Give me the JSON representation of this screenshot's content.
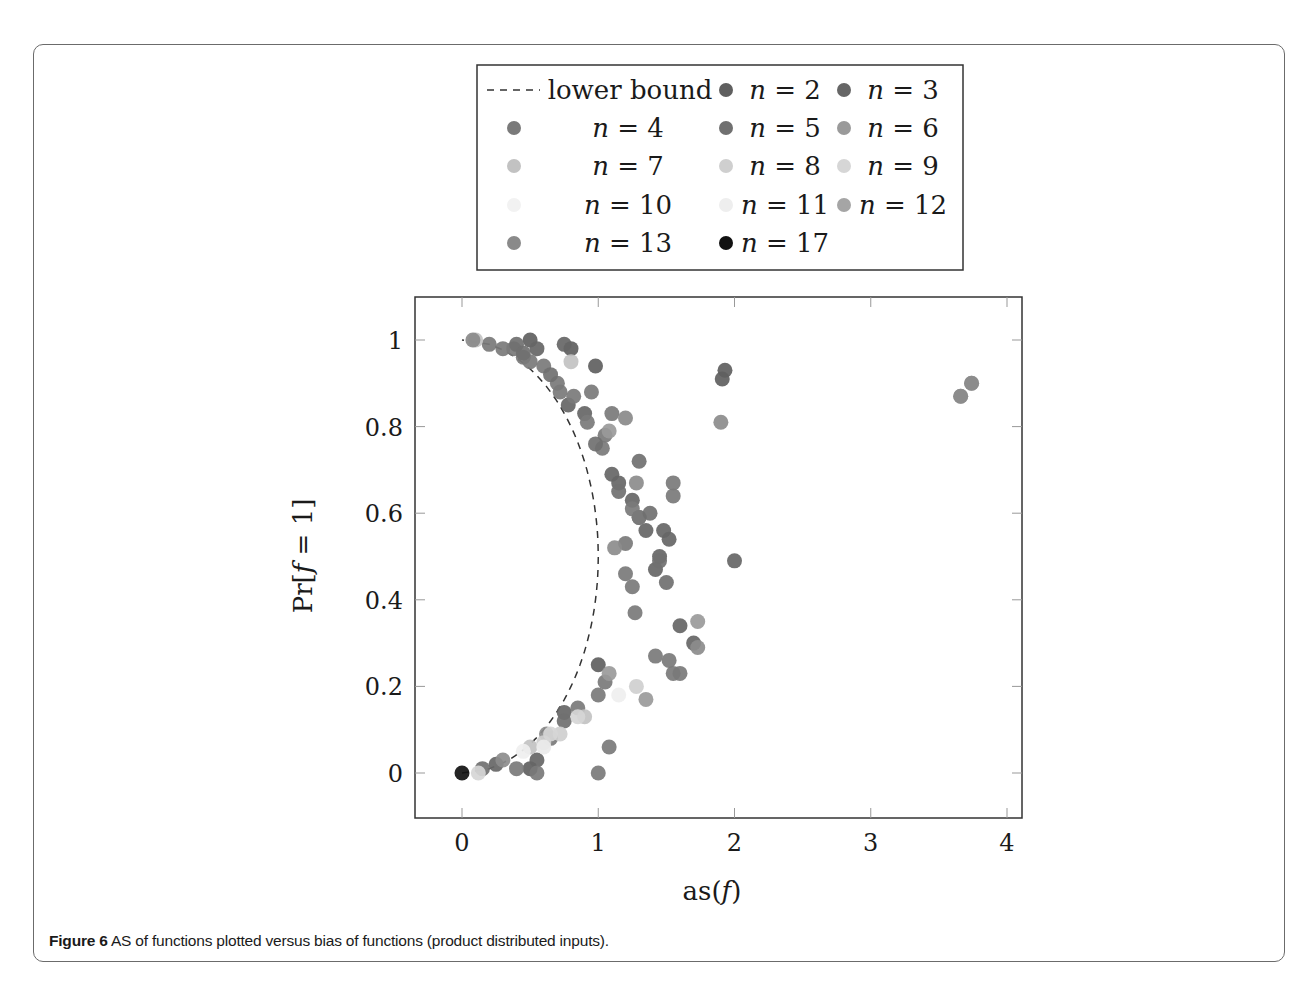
{
  "caption": {
    "label": "Figure 6",
    "text": " AS of functions plotted versus bias of functions (product distributed inputs)."
  },
  "chart_data": {
    "type": "scatter",
    "title": "",
    "xlabel": "as(f)",
    "ylabel": "Pr[f = 1]",
    "xlim": [
      -0.35,
      4.1
    ],
    "ylim": [
      -0.1,
      1.1
    ],
    "xticks": [
      0,
      1,
      2,
      3,
      4
    ],
    "yticks": [
      0,
      0.2,
      0.4,
      0.6,
      0.8,
      1
    ],
    "xtick_labels": [
      "0",
      "1",
      "2",
      "3",
      "4"
    ],
    "ytick_labels": [
      "0",
      "0.2",
      "0.4",
      "0.6",
      "0.8",
      "1"
    ],
    "grid": false,
    "legend_position": "above plot, boxed, 3 columns",
    "lower_bound": {
      "name": "lower bound",
      "style": "dashed",
      "description": "as(f) = 4 p (1 - p) ... curve from (0,0) through (~1.0,0.5) to (0,1)",
      "points": [
        [
          0,
          0
        ],
        [
          0.36,
          0.1
        ],
        [
          0.64,
          0.2
        ],
        [
          0.84,
          0.3
        ],
        [
          0.96,
          0.4
        ],
        [
          1.0,
          0.5
        ],
        [
          0.96,
          0.6
        ],
        [
          0.84,
          0.7
        ],
        [
          0.64,
          0.8
        ],
        [
          0.36,
          0.9
        ],
        [
          0,
          1
        ]
      ]
    },
    "series": [
      {
        "name": "n = 2",
        "color": "#5f5f5f",
        "points": [
          [
            0.5,
            1.0
          ],
          [
            0.8,
            0.98
          ],
          [
            0.98,
            0.94
          ],
          [
            1.93,
            0.93
          ],
          [
            1.91,
            0.91
          ],
          [
            1.0,
            0.25
          ],
          [
            0.5,
            0.01
          ]
        ]
      },
      {
        "name": "n = 3",
        "color": "#666666",
        "points": [
          [
            0.55,
            0.98
          ],
          [
            0.75,
            0.99
          ],
          [
            0.78,
            0.85
          ],
          [
            0.9,
            0.83
          ],
          [
            1.1,
            0.69
          ],
          [
            1.15,
            0.67
          ],
          [
            1.25,
            0.63
          ],
          [
            1.3,
            0.59
          ],
          [
            1.35,
            0.56
          ],
          [
            1.45,
            0.5
          ],
          [
            1.42,
            0.47
          ],
          [
            1.48,
            0.56
          ],
          [
            1.52,
            0.54
          ],
          [
            1.6,
            0.34
          ],
          [
            1.7,
            0.3
          ],
          [
            0.75,
            0.14
          ],
          [
            0.55,
            0.03
          ],
          [
            2.0,
            0.49
          ],
          [
            0.25,
            0.02
          ]
        ]
      },
      {
        "name": "n = 4",
        "color": "#7a7a7a",
        "points": [
          [
            0.2,
            0.99
          ],
          [
            0.3,
            0.98
          ],
          [
            0.38,
            0.98
          ],
          [
            0.45,
            0.96
          ],
          [
            0.5,
            0.95
          ],
          [
            0.6,
            0.94
          ],
          [
            0.7,
            0.9
          ],
          [
            0.72,
            0.88
          ],
          [
            0.82,
            0.87
          ],
          [
            0.95,
            0.88
          ],
          [
            0.92,
            0.81
          ],
          [
            1.05,
            0.78
          ],
          [
            1.03,
            0.75
          ],
          [
            1.1,
            0.83
          ],
          [
            1.25,
            0.61
          ],
          [
            1.3,
            0.59
          ],
          [
            1.55,
            0.67
          ],
          [
            1.55,
            0.64
          ],
          [
            1.2,
            0.53
          ],
          [
            1.2,
            0.46
          ],
          [
            1.25,
            0.43
          ],
          [
            1.27,
            0.37
          ],
          [
            1.42,
            0.27
          ],
          [
            1.52,
            0.26
          ],
          [
            1.55,
            0.23
          ],
          [
            1.6,
            0.23
          ],
          [
            1.0,
            0.18
          ],
          [
            1.05,
            0.21
          ],
          [
            0.85,
            0.15
          ],
          [
            0.65,
            0.08
          ],
          [
            1.08,
            0.06
          ],
          [
            1.0,
            0.0
          ],
          [
            0.55,
            0.0
          ],
          [
            0.4,
            0.01
          ]
        ]
      },
      {
        "name": "n = 5",
        "color": "#707070",
        "points": [
          [
            0.4,
            0.99
          ],
          [
            0.45,
            0.97
          ],
          [
            0.65,
            0.92
          ],
          [
            0.98,
            0.76
          ],
          [
            1.15,
            0.65
          ],
          [
            1.3,
            0.72
          ],
          [
            1.38,
            0.6
          ],
          [
            1.45,
            0.49
          ],
          [
            1.5,
            0.44
          ],
          [
            0.75,
            0.12
          ],
          [
            0.15,
            0.01
          ]
        ]
      },
      {
        "name": "n = 6",
        "color": "#8c8c8c",
        "points": [
          [
            1.28,
            0.67
          ],
          [
            1.9,
            0.81
          ],
          [
            1.12,
            0.52
          ],
          [
            1.73,
            0.29
          ],
          [
            0.62,
            0.09
          ],
          [
            0.3,
            0.03
          ]
        ]
      },
      {
        "name": "n = 7",
        "color": "#c2c2c2",
        "points": [
          [
            0.1,
            1.0
          ],
          [
            0.8,
            0.95
          ],
          [
            0.9,
            0.13
          ],
          [
            0.5,
            0.06
          ]
        ]
      },
      {
        "name": "n = 8",
        "color": "#cfcfcf",
        "points": [
          [
            1.28,
            0.2
          ],
          [
            0.72,
            0.09
          ],
          [
            0.6,
            0.07
          ]
        ]
      },
      {
        "name": "n = 9",
        "color": "#d6d6d6",
        "points": [
          [
            0.12,
            0.0
          ],
          [
            0.85,
            0.13
          ],
          [
            0.65,
            0.09
          ]
        ]
      },
      {
        "name": "n = 10",
        "color": "#efefef",
        "points": [
          [
            1.15,
            0.18
          ],
          [
            0.45,
            0.05
          ]
        ]
      },
      {
        "name": "n = 11",
        "color": "#eaeaea",
        "points": [
          [
            0.6,
            0.06
          ]
        ]
      },
      {
        "name": "n = 12",
        "color": "#9a9a9a",
        "points": [
          [
            1.73,
            0.35
          ],
          [
            1.35,
            0.17
          ],
          [
            1.08,
            0.23
          ],
          [
            1.08,
            0.79
          ],
          [
            3.74,
            0.9
          ],
          [
            3.66,
            0.87
          ]
        ]
      },
      {
        "name": "n = 13",
        "color": "#8a8a8a",
        "points": [
          [
            3.66,
            0.87
          ],
          [
            3.74,
            0.9
          ],
          [
            0.08,
            1.0
          ],
          [
            1.2,
            0.82
          ]
        ]
      },
      {
        "name": "n = 17",
        "color": "#111111",
        "points": [
          [
            0.0,
            0.0
          ]
        ]
      }
    ]
  },
  "legend": {
    "items": [
      {
        "label_prefix": "lower bound",
        "label_var": "",
        "label_val": "",
        "type": "dashed"
      },
      {
        "label_prefix": "",
        "label_var": "n",
        "label_val": " = 2",
        "color": "#5f5f5f"
      },
      {
        "label_prefix": "",
        "label_var": "n",
        "label_val": " = 3",
        "color": "#666666"
      },
      {
        "label_prefix": "",
        "label_var": "n",
        "label_val": " = 4",
        "color": "#7a7a7a"
      },
      {
        "label_prefix": "",
        "label_var": "n",
        "label_val": " = 5",
        "color": "#707070"
      },
      {
        "label_prefix": "",
        "label_var": "n",
        "label_val": " = 6",
        "color": "#9a9a9a"
      },
      {
        "label_prefix": "",
        "label_var": "n",
        "label_val": " = 7",
        "color": "#c2c2c2"
      },
      {
        "label_prefix": "",
        "label_var": "n",
        "label_val": " = 8",
        "color": "#cfcfcf"
      },
      {
        "label_prefix": "",
        "label_var": "n",
        "label_val": " = 9",
        "color": "#d6d6d6"
      },
      {
        "label_prefix": "",
        "label_var": "n",
        "label_val": " = 10",
        "color": "#f2f2f2"
      },
      {
        "label_prefix": "",
        "label_var": "n",
        "label_val": " = 11",
        "color": "#eeeeee"
      },
      {
        "label_prefix": "",
        "label_var": "n",
        "label_val": " = 12",
        "color": "#a5a5a5"
      },
      {
        "label_prefix": "",
        "label_var": "n",
        "label_val": " = 13",
        "color": "#8a8a8a"
      },
      {
        "label_prefix": "",
        "label_var": "n",
        "label_val": " = 17",
        "color": "#111111"
      }
    ]
  }
}
